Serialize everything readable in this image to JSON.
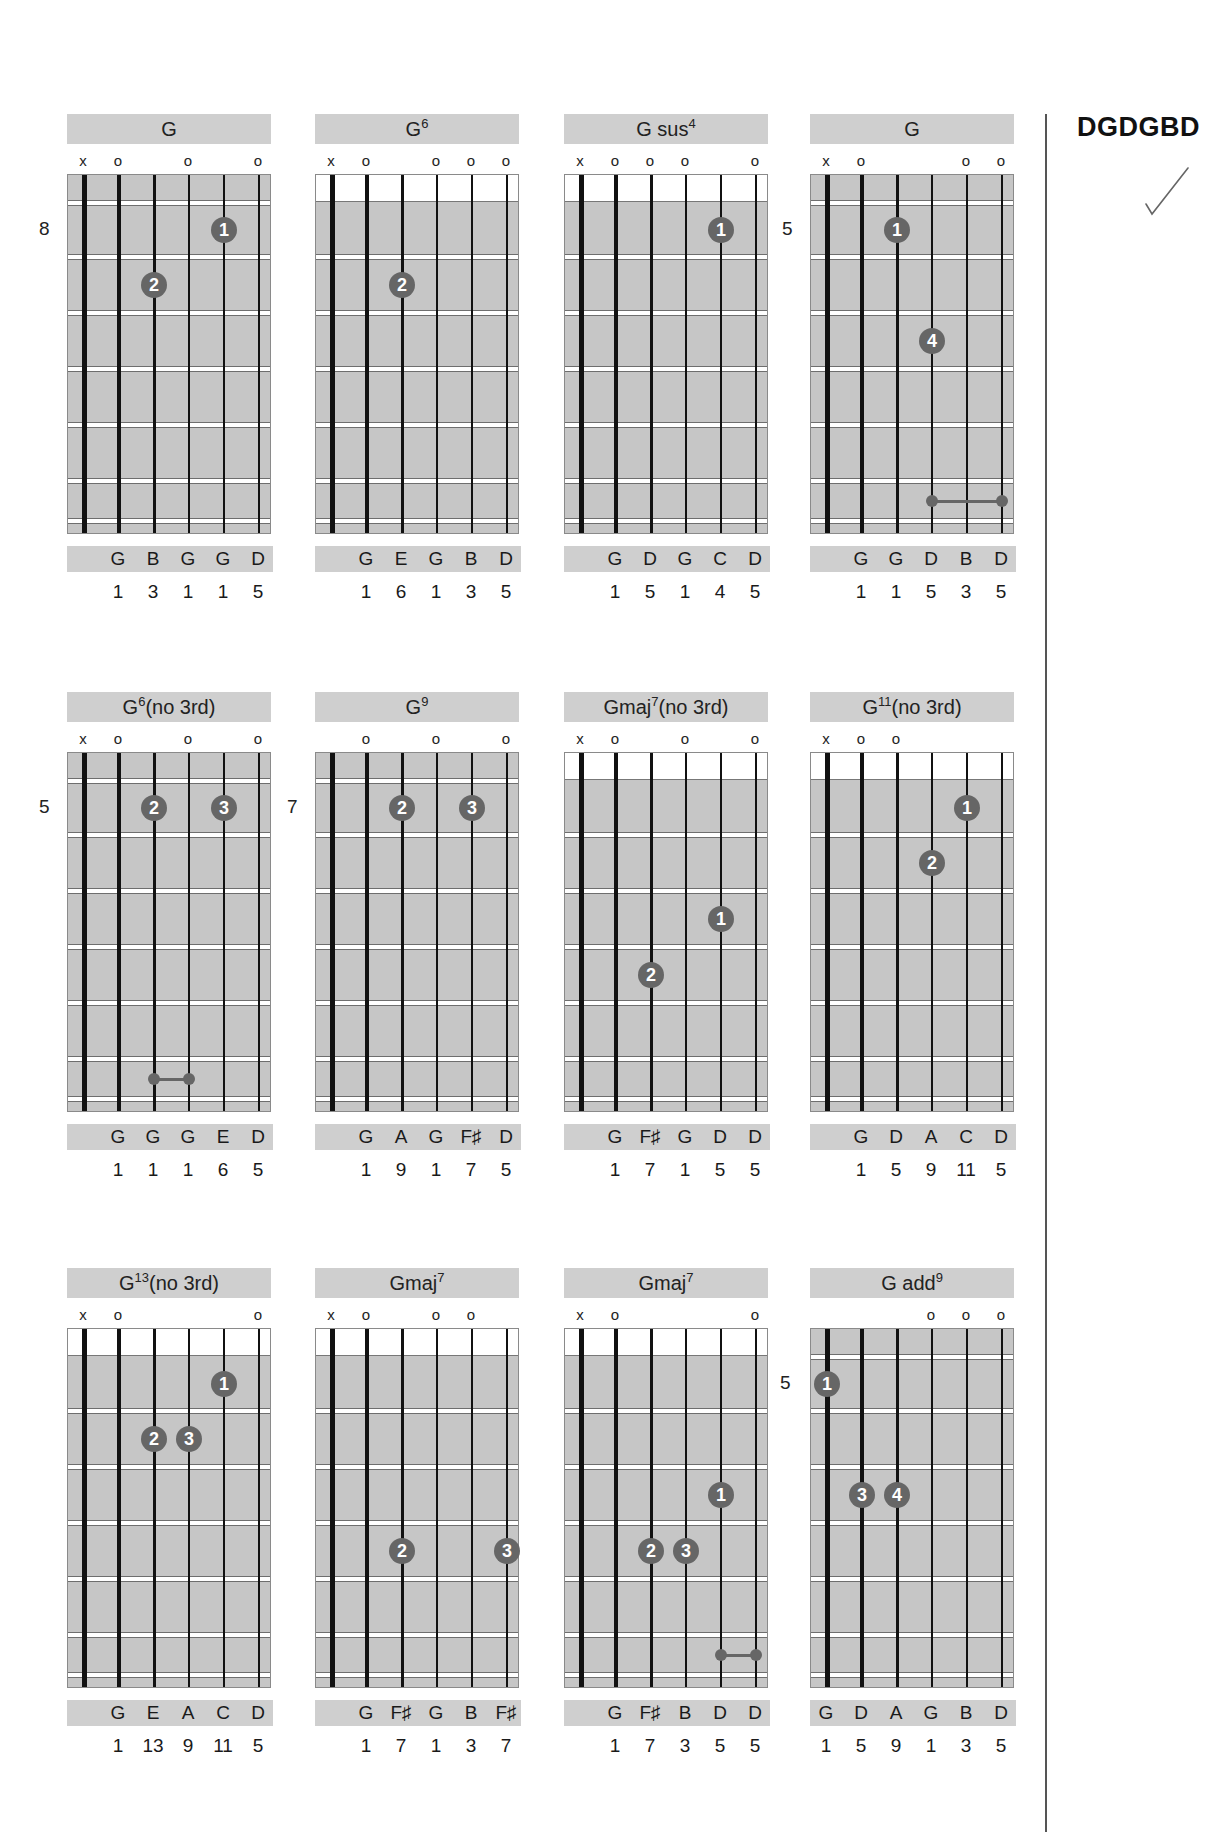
{
  "tuning": {
    "label": "DGDGBD",
    "check_mark": "✓"
  },
  "colors": {
    "grid_bg": "#c6c6c6",
    "label_bar": "#cfcfcf",
    "finger_dot": "#666666",
    "string": "#111111"
  },
  "chords": [
    {
      "name": "G",
      "sup": "",
      "suffix": "",
      "markers": [
        "x",
        "o",
        "",
        "o",
        "",
        "o"
      ],
      "fret_label": "8",
      "open_top": false,
      "fingers": [
        {
          "string": 5,
          "fret": 1,
          "finger": "1"
        },
        {
          "string": 3,
          "fret": 2,
          "finger": "2"
        }
      ],
      "barres": [],
      "notes": [
        "",
        "G",
        "B",
        "G",
        "G",
        "D"
      ],
      "degrees": [
        "",
        "1",
        "3",
        "1",
        "1",
        "5"
      ]
    },
    {
      "name": "G",
      "sup": "6",
      "suffix": "",
      "markers": [
        "x",
        "o",
        "",
        "o",
        "o",
        "o"
      ],
      "fret_label": "",
      "open_top": true,
      "fingers": [
        {
          "string": 3,
          "fret": 2,
          "finger": "2"
        }
      ],
      "barres": [],
      "notes": [
        "",
        "G",
        "E",
        "G",
        "B",
        "D"
      ],
      "degrees": [
        "",
        "1",
        "6",
        "1",
        "3",
        "5"
      ]
    },
    {
      "name": "G sus",
      "sup": "4",
      "suffix": "",
      "markers": [
        "x",
        "o",
        "o",
        "o",
        "",
        "o"
      ],
      "fret_label": "",
      "open_top": true,
      "fingers": [
        {
          "string": 5,
          "fret": 1,
          "finger": "1"
        }
      ],
      "barres": [],
      "notes": [
        "",
        "G",
        "D",
        "G",
        "C",
        "D"
      ],
      "degrees": [
        "",
        "1",
        "5",
        "1",
        "4",
        "5"
      ]
    },
    {
      "name": "G",
      "sup": "",
      "suffix": "",
      "markers": [
        "x",
        "o",
        "",
        "",
        "o",
        "o"
      ],
      "fret_label": "5",
      "open_top": false,
      "fingers": [
        {
          "string": 3,
          "fret": 1,
          "finger": "1"
        },
        {
          "string": 4,
          "fret": 3,
          "finger": "4"
        }
      ],
      "barres": [
        {
          "from": 4,
          "to": 6,
          "fret": 6
        }
      ],
      "notes": [
        "",
        "G",
        "G",
        "D",
        "B",
        "D"
      ],
      "degrees": [
        "",
        "1",
        "1",
        "5",
        "3",
        "5"
      ]
    },
    {
      "name": "G",
      "sup": "6",
      "suffix": "(no 3rd)",
      "markers": [
        "x",
        "o",
        "",
        "o",
        "",
        "o"
      ],
      "fret_label": "5",
      "open_top": false,
      "fingers": [
        {
          "string": 3,
          "fret": 1,
          "finger": "2"
        },
        {
          "string": 5,
          "fret": 1,
          "finger": "3"
        }
      ],
      "barres": [
        {
          "from": 3,
          "to": 4,
          "fret": 6
        }
      ],
      "notes": [
        "",
        "G",
        "G",
        "G",
        "E",
        "D"
      ],
      "degrees": [
        "",
        "1",
        "1",
        "1",
        "6",
        "5"
      ]
    },
    {
      "name": "G",
      "sup": "9",
      "suffix": "",
      "markers": [
        "",
        "o",
        "",
        "o",
        "",
        "o"
      ],
      "fret_label": "7",
      "open_top": false,
      "fingers": [
        {
          "string": 3,
          "fret": 1,
          "finger": "2"
        },
        {
          "string": 5,
          "fret": 1,
          "finger": "3"
        }
      ],
      "barres": [],
      "notes": [
        "",
        "G",
        "A",
        "G",
        "F♯",
        "D"
      ],
      "degrees": [
        "",
        "1",
        "9",
        "1",
        "7",
        "5"
      ]
    },
    {
      "name": "Gmaj",
      "sup": "7",
      "suffix": "(no 3rd)",
      "markers": [
        "x",
        "o",
        "",
        "o",
        "",
        "o"
      ],
      "fret_label": "",
      "open_top": true,
      "fingers": [
        {
          "string": 5,
          "fret": 3,
          "finger": "1"
        },
        {
          "string": 3,
          "fret": 4,
          "finger": "2"
        }
      ],
      "barres": [],
      "notes": [
        "",
        "G",
        "F♯",
        "G",
        "D",
        "D"
      ],
      "degrees": [
        "",
        "1",
        "7",
        "1",
        "5",
        "5"
      ]
    },
    {
      "name": "G",
      "sup": "11",
      "suffix": "(no 3rd)",
      "markers": [
        "x",
        "o",
        "o",
        "",
        "",
        ""
      ],
      "fret_label": "",
      "open_top": true,
      "fingers": [
        {
          "string": 5,
          "fret": 1,
          "finger": "1"
        },
        {
          "string": 4,
          "fret": 2,
          "finger": "2"
        }
      ],
      "barres": [],
      "notes": [
        "",
        "G",
        "D",
        "A",
        "C",
        "D"
      ],
      "degrees": [
        "",
        "1",
        "5",
        "9",
        "11",
        "5"
      ]
    },
    {
      "name": "G",
      "sup": "13",
      "suffix": "(no 3rd)",
      "markers": [
        "x",
        "o",
        "",
        "",
        "",
        "o"
      ],
      "fret_label": "",
      "open_top": true,
      "fingers": [
        {
          "string": 5,
          "fret": 1,
          "finger": "1"
        },
        {
          "string": 3,
          "fret": 2,
          "finger": "2"
        },
        {
          "string": 4,
          "fret": 2,
          "finger": "3"
        }
      ],
      "barres": [],
      "notes": [
        "",
        "G",
        "E",
        "A",
        "C",
        "D"
      ],
      "degrees": [
        "",
        "1",
        "13",
        "9",
        "11",
        "5"
      ]
    },
    {
      "name": "Gmaj",
      "sup": "7",
      "suffix": "",
      "markers": [
        "x",
        "o",
        "",
        "o",
        "o",
        ""
      ],
      "fret_label": "",
      "open_top": true,
      "fingers": [
        {
          "string": 3,
          "fret": 4,
          "finger": "2"
        },
        {
          "string": 6,
          "fret": 4,
          "finger": "3"
        }
      ],
      "barres": [],
      "notes": [
        "",
        "G",
        "F♯",
        "G",
        "B",
        "F♯"
      ],
      "degrees": [
        "",
        "1",
        "7",
        "1",
        "3",
        "7"
      ]
    },
    {
      "name": "Gmaj",
      "sup": "7",
      "suffix": "",
      "markers": [
        "x",
        "o",
        "",
        "",
        "",
        "o"
      ],
      "fret_label": "",
      "open_top": true,
      "fingers": [
        {
          "string": 5,
          "fret": 3,
          "finger": "1"
        },
        {
          "string": 3,
          "fret": 4,
          "finger": "2"
        },
        {
          "string": 4,
          "fret": 4,
          "finger": "3"
        }
      ],
      "barres": [
        {
          "from": 5,
          "to": 6,
          "fret": 6
        }
      ],
      "notes": [
        "",
        "G",
        "F♯",
        "B",
        "D",
        "D"
      ],
      "degrees": [
        "",
        "1",
        "7",
        "3",
        "5",
        "5"
      ]
    },
    {
      "name": "G add",
      "sup": "9",
      "suffix": "",
      "markers": [
        "",
        "",
        "",
        "o",
        "o",
        "o"
      ],
      "fret_label": "5",
      "open_top": false,
      "fingers": [
        {
          "string": 1,
          "fret": 1,
          "finger": "1"
        },
        {
          "string": 2,
          "fret": 3,
          "finger": "3"
        },
        {
          "string": 3,
          "fret": 3,
          "finger": "4"
        }
      ],
      "barres": [],
      "notes": [
        "G",
        "D",
        "A",
        "G",
        "B",
        "D"
      ],
      "degrees": [
        "1",
        "5",
        "9",
        "1",
        "3",
        "5"
      ]
    }
  ]
}
